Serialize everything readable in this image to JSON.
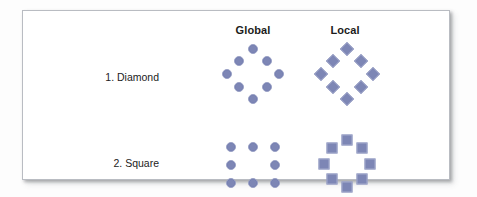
{
  "figure": {
    "background_color": "#fdfdfd",
    "panel_color": "#ffffff",
    "border_color": "#b9bcc2",
    "element_color": "#7d86b5"
  },
  "columns": [
    {
      "key": "global",
      "label": "Global"
    },
    {
      "key": "local",
      "label": "Local"
    }
  ],
  "rows": [
    {
      "key": "diamond",
      "label": "1. Diamond"
    },
    {
      "key": "square",
      "label": "2. Square"
    }
  ],
  "stimuli": [
    {
      "name": "global-diamond",
      "row": "diamond",
      "column": "global",
      "element_shape": "circle",
      "element_count": 8,
      "global_form": "diamond",
      "points": [
        [
          32,
          6
        ],
        [
          18,
          18
        ],
        [
          46,
          18
        ],
        [
          6,
          31
        ],
        [
          58,
          31
        ],
        [
          18,
          44
        ],
        [
          46,
          44
        ],
        [
          32,
          56
        ]
      ]
    },
    {
      "name": "local-diamond",
      "row": "diamond",
      "column": "local",
      "element_shape": "diamond",
      "element_count": 8,
      "global_form": "diamond",
      "points": [
        [
          32,
          6
        ],
        [
          18,
          18
        ],
        [
          46,
          18
        ],
        [
          6,
          31
        ],
        [
          58,
          31
        ],
        [
          18,
          44
        ],
        [
          46,
          44
        ],
        [
          32,
          56
        ]
      ]
    },
    {
      "name": "global-square",
      "row": "square",
      "column": "global",
      "element_shape": "circle",
      "element_count": 8,
      "global_form": "square",
      "points": [
        [
          8,
          16
        ],
        [
          30,
          16
        ],
        [
          52,
          16
        ],
        [
          8,
          34
        ],
        [
          52,
          34
        ],
        [
          8,
          52
        ],
        [
          30,
          52
        ],
        [
          52,
          52
        ]
      ]
    },
    {
      "name": "local-square",
      "row": "square",
      "column": "local",
      "element_shape": "square",
      "element_count": 8,
      "global_form": "ring",
      "points": [
        [
          32,
          9
        ],
        [
          17,
          17
        ],
        [
          47,
          17
        ],
        [
          9,
          33
        ],
        [
          55,
          33
        ],
        [
          17,
          48
        ],
        [
          47,
          48
        ],
        [
          32,
          56
        ]
      ]
    }
  ]
}
